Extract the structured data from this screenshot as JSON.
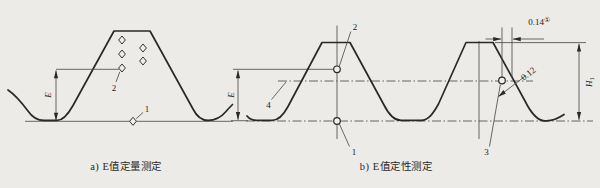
{
  "colors": {
    "paper": "#ecebe7",
    "ink": "#2b2926",
    "thin_line": "#514e4a"
  },
  "figure_a": {
    "caption": "a) E值定量测定",
    "e_dimension_label": "E",
    "point_labels": {
      "p1": "1",
      "p2": "2"
    }
  },
  "figure_b": {
    "caption": "b) E值定性测定",
    "e_dimension_label": "E",
    "h1_dimension": {
      "base": "H",
      "subscript": "1"
    },
    "crest_offset_dimension": {
      "value": "0.14",
      "footnote_mark": "①"
    },
    "flank_offset_dimension": {
      "value": "0.12"
    },
    "point_labels": {
      "p1": "1",
      "p2": "2",
      "p3": "3",
      "p4": "4"
    }
  }
}
